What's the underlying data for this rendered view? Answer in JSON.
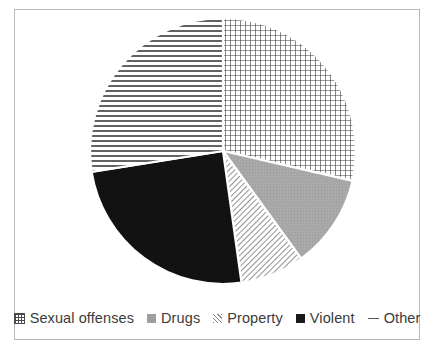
{
  "chart_data": {
    "type": "pie",
    "title": "",
    "categories": [
      "Sexual offenses",
      "Drugs",
      "Property",
      "Violent",
      "Other"
    ],
    "values": [
      28.6,
      11.4,
      7.8,
      24.7,
      27.5
    ],
    "units": "percent",
    "start_angle_deg": 0,
    "direction": "clockwise",
    "legend_position": "bottom",
    "grid": false,
    "slice_boundaries_deg": [
      0,
      103,
      144,
      172,
      261,
      360
    ],
    "slices": [
      {
        "label": "Sexual offenses",
        "value": 28.6,
        "start_deg": 0,
        "end_deg": 103,
        "pattern": "grid",
        "pattern_name": "crosshatch-grid",
        "color": "#3a3a3a"
      },
      {
        "label": "Drugs",
        "value": 11.4,
        "start_deg": 103,
        "end_deg": 144,
        "pattern": "solid-gray",
        "pattern_name": "solid-gray",
        "color": "#a6a6a6"
      },
      {
        "label": "Property",
        "value": 7.8,
        "start_deg": 144,
        "end_deg": 172,
        "pattern": "diagonal",
        "pattern_name": "diagonal-lines",
        "color": "#6e6e6e"
      },
      {
        "label": "Violent",
        "value": 24.7,
        "start_deg": 172,
        "end_deg": 261,
        "pattern": "solid-black",
        "pattern_name": "solid-black",
        "color": "#111111"
      },
      {
        "label": "Other",
        "value": 27.5,
        "start_deg": 261,
        "end_deg": 360,
        "pattern": "horizontal",
        "pattern_name": "horizontal-lines",
        "color": "#3a3a3a"
      }
    ]
  },
  "chart": {
    "center_x": 208,
    "center_y": 141,
    "radius": 133,
    "border_color": "#b9b9b9",
    "background": "#ffffff"
  },
  "legend": {
    "items": [
      {
        "label": "Sexual offenses",
        "marker": "grid-swatch"
      },
      {
        "label": "Drugs",
        "marker": "gray-square-swatch"
      },
      {
        "label": "Property",
        "marker": "diagonal-swatch"
      },
      {
        "label": "Violent",
        "marker": "black-square-swatch"
      },
      {
        "label": "Other",
        "marker": "dash-swatch"
      }
    ]
  },
  "caption": {
    "text": ""
  }
}
